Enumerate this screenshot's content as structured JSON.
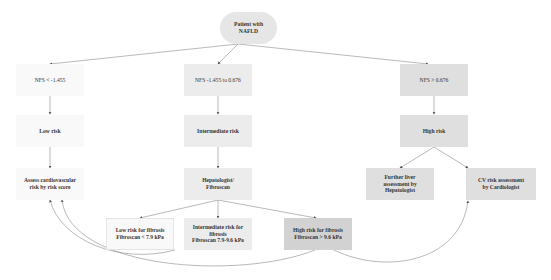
{
  "diagram": {
    "root": {
      "id": "root",
      "lines": [
        "Patient with",
        "NAFLD"
      ]
    },
    "branches": [
      {
        "id": "nfs_low",
        "label": "NFS < -1.455",
        "risk": "Low risk",
        "action": [
          "Assess cardiovascular",
          "risk by risk score"
        ]
      },
      {
        "id": "nfs_mid",
        "label": "NFS -1.455 to 0.676",
        "risk": "Intermediate risk",
        "action": [
          "Hepatologist/",
          "Fibroscan"
        ],
        "sub": [
          {
            "id": "fib_low",
            "lines": [
              "Low risk for fibrosis",
              "Fibroscan < 7.9 kPa"
            ]
          },
          {
            "id": "fib_mid",
            "lines": [
              "Intermediate risk for",
              "fibrosis",
              "Fibroscan 7.9-9.6 kPa"
            ]
          },
          {
            "id": "fib_high",
            "lines": [
              "High risk for fibrosis",
              "Fibroscan > 9.6 kPa"
            ]
          }
        ]
      },
      {
        "id": "nfs_high",
        "label": "NFS > 0.676",
        "risk": "High risk",
        "sub": [
          {
            "id": "liver_assess",
            "lines": [
              "Further liver",
              "assessment by",
              "Hepatologist"
            ]
          },
          {
            "id": "cv_assess",
            "lines": [
              "CV risk assessment",
              "by Cardiologist"
            ]
          }
        ]
      }
    ],
    "edges": [
      [
        "root",
        "nfs_low"
      ],
      [
        "root",
        "nfs_mid"
      ],
      [
        "root",
        "nfs_high"
      ],
      [
        "nfs_low",
        "low_risk"
      ],
      [
        "low_risk",
        "assess_cv"
      ],
      [
        "nfs_mid",
        "int_risk"
      ],
      [
        "int_risk",
        "hep_fib"
      ],
      [
        "hep_fib",
        "fib_low"
      ],
      [
        "hep_fib",
        "fib_mid"
      ],
      [
        "hep_fib",
        "fib_high"
      ],
      [
        "nfs_high",
        "high_risk"
      ],
      [
        "high_risk",
        "liver_assess"
      ],
      [
        "high_risk",
        "cv_assess"
      ],
      [
        "fib_low",
        "assess_cv"
      ],
      [
        "fib_mid",
        "assess_cv"
      ],
      [
        "fib_high",
        "cv_assess"
      ]
    ],
    "colors": {
      "level0": "#f9f9f9",
      "level1": "#ececec",
      "level2": "#dfdfdf",
      "level3": "#d2d2d2",
      "edge": "#888888"
    }
  }
}
